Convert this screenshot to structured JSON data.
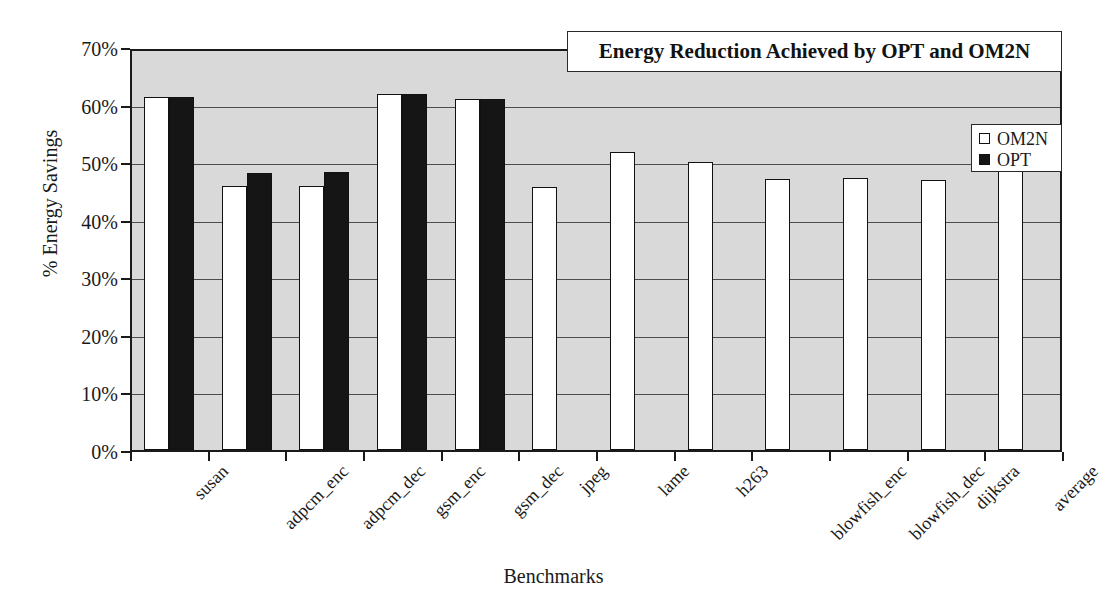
{
  "chart_data": {
    "type": "bar",
    "title": "Energy Reduction Achieved by OPT and OM2N",
    "xlabel": "Benchmarks",
    "ylabel": "% Energy Savings",
    "ylim": [
      0,
      70
    ],
    "ytick_labels": [
      "0%",
      "10%",
      "20%",
      "30%",
      "40%",
      "50%",
      "60%",
      "70%"
    ],
    "ytick_values": [
      0,
      10,
      20,
      30,
      40,
      50,
      60,
      70
    ],
    "grid": true,
    "legend_position": "upper right",
    "categories": [
      "susan",
      "adpcm_enc",
      "adpcm_dec",
      "gsm_enc",
      "gsm_dec",
      "jpeg",
      "lame",
      "h263",
      "blowfish_enc",
      "blowfish_dec",
      "dijkstra",
      "average"
    ],
    "series": [
      {
        "name": "OM2N",
        "color": "#ffffff",
        "values": [
          61.3,
          45.8,
          45.9,
          61.8,
          61.0,
          45.6,
          51.8,
          50.1,
          47.1,
          47.2,
          46.9,
          51.7
        ]
      },
      {
        "name": "OPT",
        "color": "#151515",
        "values": [
          61.4,
          48.2,
          48.3,
          61.9,
          61.0,
          0,
          0,
          0,
          0,
          0,
          0,
          0
        ]
      }
    ]
  },
  "legend": {
    "entries": [
      {
        "label": "OM2N",
        "swatch": "white-square"
      },
      {
        "label": "OPT",
        "swatch": "black-square"
      }
    ]
  }
}
